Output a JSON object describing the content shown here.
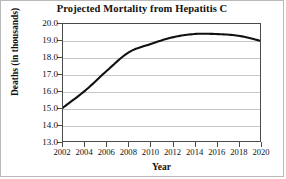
{
  "chart_data": {
    "type": "line",
    "title": "Projected Mortality from Hepatitis C",
    "xlabel": "Year",
    "ylabel": "Deaths (in thousands)",
    "x": [
      2002,
      2004,
      2006,
      2008,
      2010,
      2012,
      2014,
      2016,
      2018,
      2020
    ],
    "values": [
      15.0,
      16.0,
      17.2,
      18.3,
      18.8,
      19.2,
      19.4,
      19.4,
      19.3,
      19.0
    ],
    "xlim": [
      2002,
      2020
    ],
    "ylim": [
      13.0,
      20.0
    ],
    "xticks": [
      2002,
      2004,
      2006,
      2008,
      2010,
      2012,
      2014,
      2016,
      2018,
      2020
    ],
    "xtick_labels": [
      "2002",
      "2004",
      "2006",
      "2008",
      "2010",
      "2012",
      "2014",
      "2016",
      "2018",
      "2020"
    ],
    "yticks": [
      13.0,
      14.0,
      15.0,
      16.0,
      17.0,
      18.0,
      19.0,
      20.0
    ],
    "ytick_labels": [
      "13.0",
      "14.0",
      "15.0",
      "16.0",
      "17.0",
      "18.0",
      "19.0",
      "20.0"
    ],
    "grid": "horizontal",
    "grid_color": "#c8c8c8",
    "legend": null,
    "series_color": "#111111",
    "series_name": "Projected deaths"
  }
}
